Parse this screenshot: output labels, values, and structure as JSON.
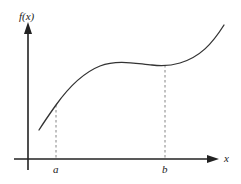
{
  "figure": {
    "y_axis_label": "f(x)",
    "x_axis_label": "x",
    "marks": [
      {
        "label": "a",
        "x_px": 56
      },
      {
        "label": "b",
        "x_px": 165
      }
    ],
    "colors": {
      "axis": "#222222",
      "curve": "#333333",
      "dashed": "#777777",
      "background": "#ffffff"
    },
    "curve": {
      "description": "Smooth increasing cubic-like curve: rises steeply from lower-left, levels into a plateau, slight dip near b, then rises steeply to upper-right",
      "points_px": [
        [
          39,
          130
        ],
        [
          56,
          105
        ],
        [
          80,
          78
        ],
        [
          110,
          63
        ],
        [
          140,
          63
        ],
        [
          165,
          65
        ],
        [
          195,
          55
        ],
        [
          224,
          25
        ]
      ]
    }
  }
}
